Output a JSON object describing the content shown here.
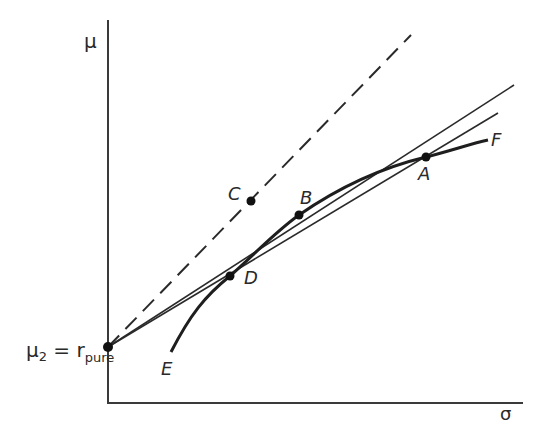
{
  "diagram": {
    "type": "efficient-frontier",
    "axes": {
      "y_label": "μ",
      "x_label": "σ"
    },
    "intercept_label": {
      "main": "μ",
      "main_sub": "2",
      "equals": " = r",
      "r_sub": "pure"
    },
    "points": {
      "A": "A",
      "B": "B",
      "C": "C",
      "D": "D",
      "E": "E",
      "F": "F"
    },
    "colors": {
      "line": "#2a2a2a",
      "background": "#ffffff"
    }
  }
}
